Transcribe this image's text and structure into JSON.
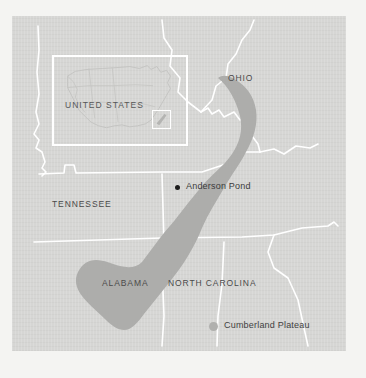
{
  "figure": {
    "type": "reference-map",
    "background_color": "#d6d6d4",
    "plateau_color": "#adadab",
    "border_color": "#ffffff",
    "marker_color": "#1d1d1d"
  },
  "labels": {
    "ohio": "OHIO",
    "tennessee": "TENNESSEE",
    "alabama": "ALABAMA",
    "north_carolina": "NORTH CAROLINA"
  },
  "marker": {
    "anderson_pond": "Anderson Pond"
  },
  "legend": {
    "cumberland_plateau": "Cumberland Plateau"
  },
  "inset": {
    "title": "UNITED STATES"
  }
}
